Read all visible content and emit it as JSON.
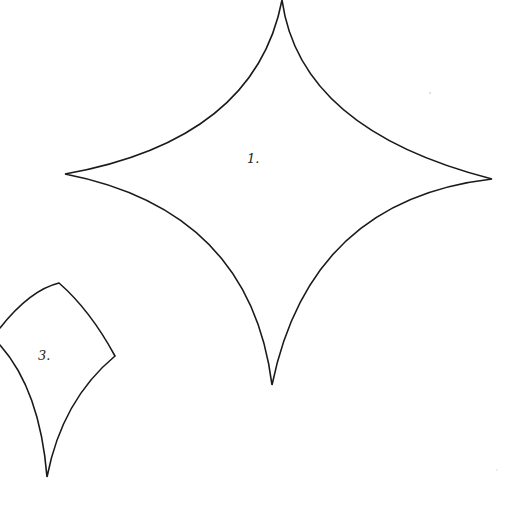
{
  "shapes": [
    {
      "id": "star",
      "label": "1.",
      "label_x": 247,
      "label_y": 152,
      "stroke": "#1a1a1a",
      "points": {
        "top": [
          282,
          0
        ],
        "right": [
          492,
          179
        ],
        "bottom": [
          272,
          385
        ],
        "left": [
          65,
          174
        ]
      }
    },
    {
      "id": "kite",
      "label": "3.",
      "label_x": 38,
      "label_y": 349,
      "stroke": "#1a1a1a",
      "points": {
        "top": [
          59,
          283
        ],
        "right": [
          115,
          356
        ],
        "bottom": [
          47,
          477
        ],
        "left": [
          0,
          340
        ]
      }
    }
  ],
  "background": "#ffffff"
}
